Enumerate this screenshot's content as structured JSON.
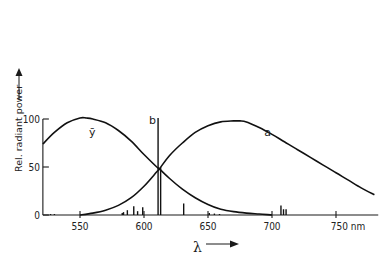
{
  "chart_data": {
    "type": "line",
    "title": "",
    "xlabel": "λ",
    "xunit": "nm",
    "ylabel": "Rel. radiant power",
    "xlim": [
      521,
      783
    ],
    "ylim": [
      0,
      100
    ],
    "x_ticks": [
      550,
      600,
      650,
      700,
      750
    ],
    "x_tick_labels": [
      "550",
      "600",
      "650",
      "700",
      "750 nm"
    ],
    "y_ticks": [
      0,
      50,
      100
    ],
    "y_tick_labels": [
      "0",
      "50",
      "100"
    ],
    "grid": false,
    "legend": "inline labels",
    "series": [
      {
        "name": "ȳ",
        "label": "ȳ",
        "x": [
          521,
          530,
          540,
          550,
          555,
          560,
          570,
          580,
          590,
          600,
          610,
          612,
          620,
          630,
          640,
          650,
          660,
          670,
          680,
          690,
          700
        ],
        "values": [
          74,
          86,
          96,
          101,
          101,
          100,
          96,
          88,
          77,
          63,
          50,
          48,
          38,
          27,
          18,
          11,
          6,
          3.5,
          2,
          1,
          0
        ]
      },
      {
        "name": "a",
        "label": "a",
        "x": [
          550,
          560,
          570,
          580,
          590,
          600,
          610,
          612,
          620,
          630,
          640,
          650,
          660,
          670,
          675,
          680,
          690,
          700,
          710,
          720,
          730,
          740,
          750,
          760,
          770,
          780
        ],
        "values": [
          0,
          2,
          5,
          10,
          18,
          30,
          45,
          48,
          62,
          75,
          86,
          93,
          97,
          98,
          98,
          97,
          91,
          84,
          76,
          68,
          60,
          52,
          44,
          36,
          28,
          21
        ]
      }
    ],
    "spectral_lines": {
      "name": "b",
      "label": "b",
      "x": [
        527,
        530,
        583,
        584,
        587,
        592,
        595,
        599,
        611,
        613,
        631,
        651,
        655,
        659,
        707,
        709,
        711
      ],
      "values": [
        1,
        1,
        2,
        3,
        5,
        9,
        4,
        8,
        101,
        50,
        12,
        2,
        1.5,
        1,
        10,
        6,
        6
      ]
    },
    "annotations": [
      {
        "text": "ȳ",
        "x": 557,
        "y": 82
      },
      {
        "text": "b",
        "x": 604,
        "y": 95
      },
      {
        "text": "a",
        "x": 694,
        "y": 82
      }
    ]
  }
}
